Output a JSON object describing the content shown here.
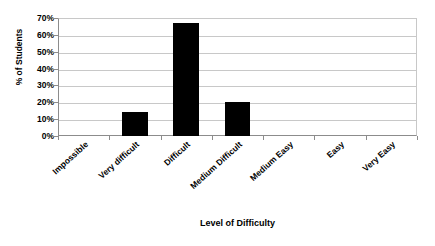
{
  "chart_data": {
    "type": "bar",
    "title": "",
    "xlabel": "Level of Difficulty",
    "ylabel": "% of Students",
    "categories": [
      "Impossible",
      "Very difficult",
      "Difficult",
      "Medium Difficult",
      "Medium Easy",
      "Easy",
      "Very Easy"
    ],
    "values": [
      0,
      14,
      67,
      20,
      0,
      0,
      0
    ],
    "ylim": [
      0,
      70
    ],
    "ytick_labels": [
      "0%",
      "10%",
      "20%",
      "30%",
      "40%",
      "50%",
      "60%",
      "70%"
    ],
    "ytick_values": [
      0,
      10,
      20,
      30,
      40,
      50,
      60,
      70
    ],
    "grid": "horizontal",
    "legend": "none",
    "bar_color": "#000000",
    "gridline_color": "#c8c8c8",
    "axis_color": "#8c8c8c",
    "background_color": "#ffffff"
  }
}
